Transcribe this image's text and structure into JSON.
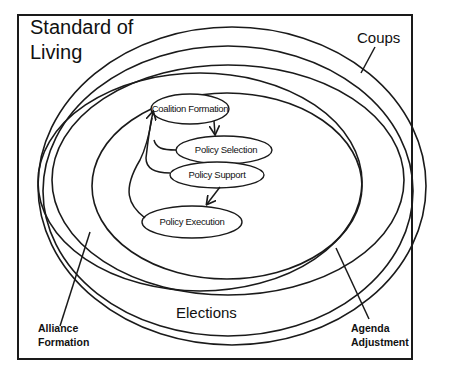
{
  "diagram": {
    "title_line1": "Standard of",
    "title_line2": "Living",
    "rings": [
      {
        "id": "coups",
        "label": "Coups"
      },
      {
        "id": "elections",
        "label": "Elections"
      },
      {
        "id": "alliance-formation",
        "label_line1": "Alliance",
        "label_line2": "Formation"
      },
      {
        "id": "agenda-adjustment",
        "label_line1": "Agenda",
        "label_line2": "Adjustment"
      }
    ],
    "nodes": [
      {
        "id": "coalition-formation",
        "label": "Coalition Formation"
      },
      {
        "id": "policy-selection",
        "label": "Policy Selection"
      },
      {
        "id": "policy-support",
        "label": "Policy Support"
      },
      {
        "id": "policy-execution",
        "label": "Policy Execution"
      }
    ]
  }
}
